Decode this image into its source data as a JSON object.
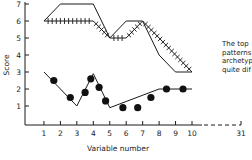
{
  "chart_data": {
    "type": "line",
    "title": "",
    "xlabel": "Variable number",
    "ylabel": "Score",
    "xlim": [
      0,
      31
    ],
    "ylim": [
      0,
      7
    ],
    "x_ticks": [
      1,
      2,
      3,
      4,
      5,
      6,
      7,
      8,
      9,
      10,
      31
    ],
    "x_tick_labels": [
      "1",
      "2",
      "3",
      "4",
      "5",
      "6",
      "7",
      "8",
      "9",
      "10",
      "31"
    ],
    "y_ticks": [
      1,
      2,
      3,
      4,
      5,
      6,
      7
    ],
    "y_tick_labels": [
      "1",
      "2",
      "3",
      "4",
      "5",
      "6",
      "7"
    ],
    "axis_break": "dashed x-axis between 10 and 31",
    "grid": false,
    "legend": "none",
    "series": [
      {
        "name": "plain",
        "style": "solid line",
        "x": [
          1,
          2,
          4,
          5,
          6,
          7,
          8,
          9,
          10
        ],
        "y": [
          6,
          7,
          7,
          5,
          6,
          6,
          4,
          3,
          3
        ]
      },
      {
        "name": "hatched",
        "style": "line with cross-hatch ticks",
        "x": [
          1,
          4,
          5,
          6,
          7,
          10
        ],
        "y": [
          6,
          6,
          5,
          5,
          6,
          3
        ]
      },
      {
        "name": "dotted",
        "style": "line with filled circle markers",
        "x": [
          1,
          3,
          4,
          5,
          8,
          10
        ],
        "y": [
          3,
          1,
          2.9,
          0.9,
          2,
          2
        ],
        "markers": [
          {
            "x": 1.6,
            "y": 2.5
          },
          {
            "x": 2.6,
            "y": 1.5
          },
          {
            "x": 3.5,
            "y": 1.8
          },
          {
            "x": 3.85,
            "y": 2.6
          },
          {
            "x": 4.35,
            "y": 2.1
          },
          {
            "x": 4.75,
            "y": 1.3
          },
          {
            "x": 5.8,
            "y": 0.9
          },
          {
            "x": 6.7,
            "y": 0.9
          },
          {
            "x": 7.5,
            "y": 1.5
          },
          {
            "x": 8.45,
            "y": 2
          },
          {
            "x": 9.45,
            "y": 2
          }
        ]
      }
    ]
  },
  "side_text": [
    "The top",
    "patterns",
    "archetyp",
    "quite dif"
  ]
}
